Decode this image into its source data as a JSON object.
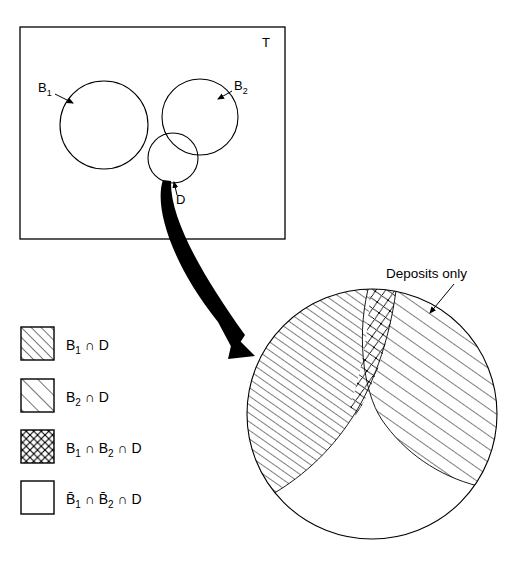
{
  "figure": {
    "universe_label": "T",
    "set_b1_label": "B",
    "set_b1_sub": "1",
    "set_b2_label": "B",
    "set_b2_sub": "2",
    "set_d_label": "D",
    "callout_label": "Deposits only",
    "background_color": "#ffffff",
    "ink_color": "#000000"
  },
  "legend": {
    "items": [
      {
        "pattern": "dense-diagonal-hatch",
        "swatch_name": "legend-swatch-b1-d",
        "text_parts": [
          "B",
          "1",
          " ∩ D"
        ],
        "label": "B1 ∩ D",
        "region": "B1 intersect D"
      },
      {
        "pattern": "sparse-diagonal-hatch",
        "swatch_name": "legend-swatch-b2-d",
        "text_parts": [
          "B",
          "2",
          " ∩ D"
        ],
        "label": "B2 ∩ D",
        "region": "B2 intersect D"
      },
      {
        "pattern": "cross-hatch",
        "swatch_name": "legend-swatch-b1-b2-d",
        "text_parts": [
          "B",
          "1",
          " ∩ B",
          "2",
          " ∩ D"
        ],
        "label": "B1 ∩ B2 ∩ D",
        "region": "B1 intersect B2 intersect D"
      },
      {
        "pattern": "empty-white",
        "swatch_name": "legend-swatch-not-b1-not-b2-d",
        "text_parts": [
          "B̄",
          "1",
          " ∩ B̄",
          "2",
          " ∩ D"
        ],
        "label": "̅B1 ∩ ̅B2 ∩ D",
        "region": "complement B1 intersect complement B2 intersect D"
      }
    ]
  },
  "venn": {
    "universe_box": {
      "x": 20,
      "y": 27,
      "width": 265,
      "height": 212
    },
    "circles": [
      {
        "name": "B1",
        "cx": 104,
        "cy": 125,
        "r": 44
      },
      {
        "name": "B2",
        "cx": 200,
        "cy": 117,
        "r": 38
      },
      {
        "name": "D",
        "cx": 173,
        "cy": 158,
        "r": 25
      }
    ]
  },
  "detail": {
    "circle": {
      "name": "D-magnified",
      "cx": 372,
      "cy": 414,
      "r": 125
    }
  }
}
